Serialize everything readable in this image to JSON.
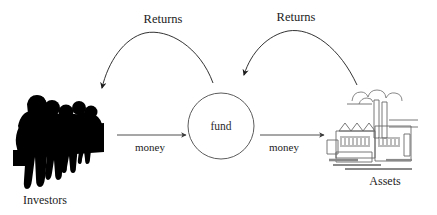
{
  "diagram": {
    "background_color": "#ffffff",
    "line_color": "#3a3a3a",
    "text_color": "#1c1c1c",
    "silhouette_color": "#000000",
    "nodes": [
      {
        "id": "investors",
        "label": "Investors",
        "icon": "crowd-silhouette-icon",
        "x": 45,
        "y": 200
      },
      {
        "id": "fund",
        "label": "fund",
        "shape": "circle",
        "cx": 221,
        "cy": 126,
        "r": 33
      },
      {
        "id": "assets",
        "label": "Assets",
        "icon": "factory-icon",
        "x": 385,
        "y": 181
      }
    ],
    "edges": [
      {
        "id": "investors-to-fund",
        "label": "money",
        "style": "straight-arrow",
        "direction": "right",
        "label_x": 150,
        "label_y": 148
      },
      {
        "id": "fund-to-assets",
        "label": "money",
        "style": "straight-arrow",
        "direction": "right",
        "label_x": 284,
        "label_y": 148
      },
      {
        "id": "fund-to-investors",
        "label": "Returns",
        "style": "curved-arrow",
        "direction": "left",
        "label_x": 163,
        "label_y": 20
      },
      {
        "id": "assets-to-fund",
        "label": "Returns",
        "style": "curved-arrow",
        "direction": "left",
        "label_x": 296,
        "label_y": 18
      }
    ]
  }
}
